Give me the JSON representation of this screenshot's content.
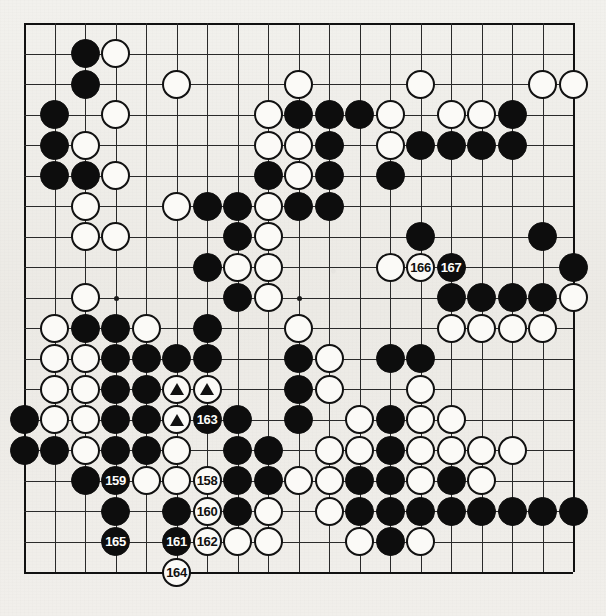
{
  "diagram": {
    "kind": "go-board-diagram",
    "board_size": 19,
    "geometry": {
      "origin_x": 24,
      "origin_y": 23,
      "spacing": 30.5,
      "stone_radius": 14.5
    },
    "colors": {
      "paper": "#efeeea",
      "line": "#2a2a2a",
      "black_stone": "#0d0d0d",
      "white_stone": "#fbfaf7",
      "white_stone_border": "#111111",
      "black_label_text": "#fdfdfb",
      "white_label_text": "#111111"
    },
    "star_points": [
      {
        "col": 3,
        "row": 3
      },
      {
        "col": 9,
        "row": 3
      },
      {
        "col": 15,
        "row": 3
      },
      {
        "col": 3,
        "row": 9
      },
      {
        "col": 9,
        "row": 9
      },
      {
        "col": 15,
        "row": 9
      },
      {
        "col": 3,
        "row": 15
      },
      {
        "col": 9,
        "row": 15
      },
      {
        "col": 15,
        "row": 15
      }
    ],
    "stones": [
      {
        "col": 2,
        "row": 1,
        "color": "black"
      },
      {
        "col": 3,
        "row": 1,
        "color": "white"
      },
      {
        "col": 2,
        "row": 2,
        "color": "black"
      },
      {
        "col": 5,
        "row": 2,
        "color": "white"
      },
      {
        "col": 9,
        "row": 2,
        "color": "white"
      },
      {
        "col": 13,
        "row": 2,
        "color": "white"
      },
      {
        "col": 17,
        "row": 2,
        "color": "white"
      },
      {
        "col": 18,
        "row": 2,
        "color": "white"
      },
      {
        "col": 1,
        "row": 3,
        "color": "black"
      },
      {
        "col": 3,
        "row": 3,
        "color": "white"
      },
      {
        "col": 8,
        "row": 3,
        "color": "white"
      },
      {
        "col": 9,
        "row": 3,
        "color": "black"
      },
      {
        "col": 10,
        "row": 3,
        "color": "black"
      },
      {
        "col": 11,
        "row": 3,
        "color": "black"
      },
      {
        "col": 12,
        "row": 3,
        "color": "white"
      },
      {
        "col": 14,
        "row": 3,
        "color": "white"
      },
      {
        "col": 15,
        "row": 3,
        "color": "white"
      },
      {
        "col": 16,
        "row": 3,
        "color": "black"
      },
      {
        "col": 1,
        "row": 4,
        "color": "black"
      },
      {
        "col": 2,
        "row": 4,
        "color": "white"
      },
      {
        "col": 8,
        "row": 4,
        "color": "white"
      },
      {
        "col": 9,
        "row": 4,
        "color": "white"
      },
      {
        "col": 10,
        "row": 4,
        "color": "black"
      },
      {
        "col": 12,
        "row": 4,
        "color": "white"
      },
      {
        "col": 13,
        "row": 4,
        "color": "black"
      },
      {
        "col": 14,
        "row": 4,
        "color": "black"
      },
      {
        "col": 15,
        "row": 4,
        "color": "black"
      },
      {
        "col": 16,
        "row": 4,
        "color": "black"
      },
      {
        "col": 1,
        "row": 5,
        "color": "black"
      },
      {
        "col": 2,
        "row": 5,
        "color": "black"
      },
      {
        "col": 3,
        "row": 5,
        "color": "white"
      },
      {
        "col": 8,
        "row": 5,
        "color": "black"
      },
      {
        "col": 9,
        "row": 5,
        "color": "white"
      },
      {
        "col": 10,
        "row": 5,
        "color": "black"
      },
      {
        "col": 12,
        "row": 5,
        "color": "black"
      },
      {
        "col": 2,
        "row": 6,
        "color": "white"
      },
      {
        "col": 5,
        "row": 6,
        "color": "white"
      },
      {
        "col": 6,
        "row": 6,
        "color": "black"
      },
      {
        "col": 7,
        "row": 6,
        "color": "black"
      },
      {
        "col": 8,
        "row": 6,
        "color": "white"
      },
      {
        "col": 9,
        "row": 6,
        "color": "black"
      },
      {
        "col": 10,
        "row": 6,
        "color": "black"
      },
      {
        "col": 2,
        "row": 7,
        "color": "white"
      },
      {
        "col": 3,
        "row": 7,
        "color": "white"
      },
      {
        "col": 7,
        "row": 7,
        "color": "black"
      },
      {
        "col": 8,
        "row": 7,
        "color": "white"
      },
      {
        "col": 13,
        "row": 7,
        "color": "black"
      },
      {
        "col": 17,
        "row": 7,
        "color": "black"
      },
      {
        "col": 6,
        "row": 8,
        "color": "black"
      },
      {
        "col": 7,
        "row": 8,
        "color": "white"
      },
      {
        "col": 8,
        "row": 8,
        "color": "white"
      },
      {
        "col": 12,
        "row": 8,
        "color": "white"
      },
      {
        "col": 13,
        "row": 8,
        "color": "white",
        "label": "166"
      },
      {
        "col": 14,
        "row": 8,
        "color": "black",
        "label": "167"
      },
      {
        "col": 18,
        "row": 8,
        "color": "black"
      },
      {
        "col": 2,
        "row": 9,
        "color": "white"
      },
      {
        "col": 7,
        "row": 9,
        "color": "black"
      },
      {
        "col": 8,
        "row": 9,
        "color": "white"
      },
      {
        "col": 14,
        "row": 9,
        "color": "black"
      },
      {
        "col": 15,
        "row": 9,
        "color": "black"
      },
      {
        "col": 16,
        "row": 9,
        "color": "black"
      },
      {
        "col": 17,
        "row": 9,
        "color": "black"
      },
      {
        "col": 18,
        "row": 9,
        "color": "white"
      },
      {
        "col": 1,
        "row": 10,
        "color": "white"
      },
      {
        "col": 2,
        "row": 10,
        "color": "black"
      },
      {
        "col": 3,
        "row": 10,
        "color": "black"
      },
      {
        "col": 4,
        "row": 10,
        "color": "white"
      },
      {
        "col": 6,
        "row": 10,
        "color": "black"
      },
      {
        "col": 9,
        "row": 10,
        "color": "white"
      },
      {
        "col": 14,
        "row": 10,
        "color": "white"
      },
      {
        "col": 15,
        "row": 10,
        "color": "white"
      },
      {
        "col": 16,
        "row": 10,
        "color": "white"
      },
      {
        "col": 17,
        "row": 10,
        "color": "white"
      },
      {
        "col": 1,
        "row": 11,
        "color": "white"
      },
      {
        "col": 2,
        "row": 11,
        "color": "white"
      },
      {
        "col": 3,
        "row": 11,
        "color": "black"
      },
      {
        "col": 4,
        "row": 11,
        "color": "black"
      },
      {
        "col": 5,
        "row": 11,
        "color": "black"
      },
      {
        "col": 6,
        "row": 11,
        "color": "black"
      },
      {
        "col": 9,
        "row": 11,
        "color": "black"
      },
      {
        "col": 10,
        "row": 11,
        "color": "white"
      },
      {
        "col": 12,
        "row": 11,
        "color": "black"
      },
      {
        "col": 13,
        "row": 11,
        "color": "black"
      },
      {
        "col": 1,
        "row": 12,
        "color": "white"
      },
      {
        "col": 2,
        "row": 12,
        "color": "white"
      },
      {
        "col": 3,
        "row": 12,
        "color": "black"
      },
      {
        "col": 4,
        "row": 12,
        "color": "black"
      },
      {
        "col": 5,
        "row": 12,
        "color": "white",
        "mark": "triangle"
      },
      {
        "col": 6,
        "row": 12,
        "color": "white",
        "mark": "triangle"
      },
      {
        "col": 9,
        "row": 12,
        "color": "black"
      },
      {
        "col": 10,
        "row": 12,
        "color": "white"
      },
      {
        "col": 13,
        "row": 12,
        "color": "white"
      },
      {
        "col": 0,
        "row": 13,
        "color": "black"
      },
      {
        "col": 1,
        "row": 13,
        "color": "white"
      },
      {
        "col": 2,
        "row": 13,
        "color": "white"
      },
      {
        "col": 3,
        "row": 13,
        "color": "black"
      },
      {
        "col": 4,
        "row": 13,
        "color": "black"
      },
      {
        "col": 5,
        "row": 13,
        "color": "white",
        "mark": "triangle"
      },
      {
        "col": 6,
        "row": 13,
        "color": "black",
        "label": "163"
      },
      {
        "col": 7,
        "row": 13,
        "color": "black"
      },
      {
        "col": 9,
        "row": 13,
        "color": "black"
      },
      {
        "col": 11,
        "row": 13,
        "color": "white"
      },
      {
        "col": 12,
        "row": 13,
        "color": "black"
      },
      {
        "col": 13,
        "row": 13,
        "color": "white"
      },
      {
        "col": 14,
        "row": 13,
        "color": "white"
      },
      {
        "col": 0,
        "row": 14,
        "color": "black"
      },
      {
        "col": 1,
        "row": 14,
        "color": "black"
      },
      {
        "col": 2,
        "row": 14,
        "color": "white"
      },
      {
        "col": 3,
        "row": 14,
        "color": "black"
      },
      {
        "col": 4,
        "row": 14,
        "color": "black"
      },
      {
        "col": 5,
        "row": 14,
        "color": "white"
      },
      {
        "col": 7,
        "row": 14,
        "color": "black"
      },
      {
        "col": 8,
        "row": 14,
        "color": "black"
      },
      {
        "col": 10,
        "row": 14,
        "color": "white"
      },
      {
        "col": 11,
        "row": 14,
        "color": "white"
      },
      {
        "col": 12,
        "row": 14,
        "color": "black"
      },
      {
        "col": 13,
        "row": 14,
        "color": "white"
      },
      {
        "col": 14,
        "row": 14,
        "color": "white"
      },
      {
        "col": 15,
        "row": 14,
        "color": "white"
      },
      {
        "col": 16,
        "row": 14,
        "color": "white"
      },
      {
        "col": 2,
        "row": 15,
        "color": "black"
      },
      {
        "col": 3,
        "row": 15,
        "color": "black",
        "label": "159"
      },
      {
        "col": 4,
        "row": 15,
        "color": "white"
      },
      {
        "col": 5,
        "row": 15,
        "color": "white"
      },
      {
        "col": 6,
        "row": 15,
        "color": "white",
        "label": "158"
      },
      {
        "col": 7,
        "row": 15,
        "color": "black"
      },
      {
        "col": 8,
        "row": 15,
        "color": "black"
      },
      {
        "col": 9,
        "row": 15,
        "color": "white"
      },
      {
        "col": 10,
        "row": 15,
        "color": "white"
      },
      {
        "col": 11,
        "row": 15,
        "color": "black"
      },
      {
        "col": 12,
        "row": 15,
        "color": "black"
      },
      {
        "col": 13,
        "row": 15,
        "color": "white"
      },
      {
        "col": 14,
        "row": 15,
        "color": "black"
      },
      {
        "col": 15,
        "row": 15,
        "color": "white"
      },
      {
        "col": 3,
        "row": 16,
        "color": "black"
      },
      {
        "col": 5,
        "row": 16,
        "color": "black"
      },
      {
        "col": 6,
        "row": 16,
        "color": "white",
        "label": "160"
      },
      {
        "col": 7,
        "row": 16,
        "color": "black"
      },
      {
        "col": 8,
        "row": 16,
        "color": "white"
      },
      {
        "col": 10,
        "row": 16,
        "color": "white"
      },
      {
        "col": 11,
        "row": 16,
        "color": "black"
      },
      {
        "col": 12,
        "row": 16,
        "color": "black"
      },
      {
        "col": 13,
        "row": 16,
        "color": "black"
      },
      {
        "col": 14,
        "row": 16,
        "color": "black"
      },
      {
        "col": 15,
        "row": 16,
        "color": "black"
      },
      {
        "col": 16,
        "row": 16,
        "color": "black"
      },
      {
        "col": 17,
        "row": 16,
        "color": "black"
      },
      {
        "col": 18,
        "row": 16,
        "color": "black"
      },
      {
        "col": 3,
        "row": 17,
        "color": "black",
        "label": "165"
      },
      {
        "col": 5,
        "row": 17,
        "color": "black",
        "label": "161"
      },
      {
        "col": 6,
        "row": 17,
        "color": "white",
        "label": "162"
      },
      {
        "col": 7,
        "row": 17,
        "color": "white"
      },
      {
        "col": 8,
        "row": 17,
        "color": "white"
      },
      {
        "col": 11,
        "row": 17,
        "color": "white"
      },
      {
        "col": 12,
        "row": 17,
        "color": "black"
      },
      {
        "col": 13,
        "row": 17,
        "color": "white"
      },
      {
        "col": 5,
        "row": 18,
        "color": "white",
        "label": "164"
      }
    ]
  }
}
